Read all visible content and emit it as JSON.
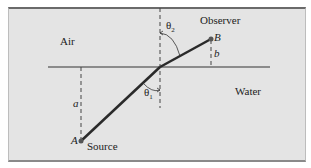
{
  "diagram": {
    "media": {
      "upper": "Air",
      "lower": "Water"
    },
    "points": {
      "source": {
        "letter": "A",
        "label": "Source"
      },
      "observer": {
        "letter": "B",
        "label": "Observer"
      }
    },
    "distances": {
      "source_depth": "a",
      "observer_height": "b"
    },
    "angles": {
      "incidence": "θ",
      "incidence_sub": "1",
      "refraction": "θ",
      "refraction_sub": "2"
    },
    "colors": {
      "background": "#e4e4e4",
      "ray": "#2a2a2a",
      "text": "#222222"
    }
  }
}
